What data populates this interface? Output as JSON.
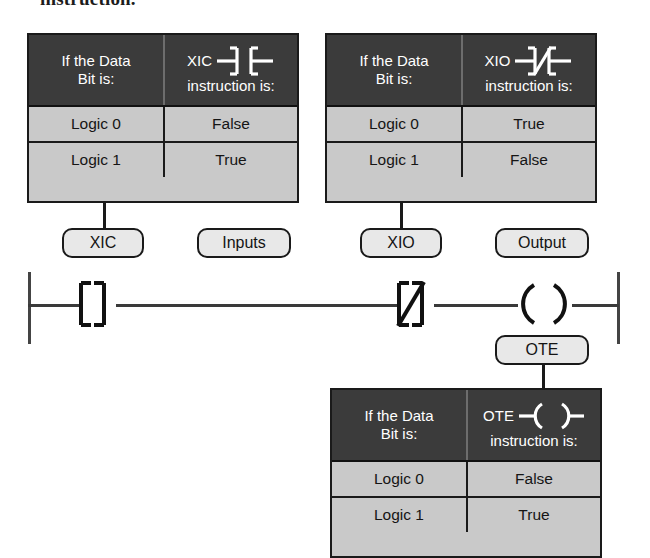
{
  "caption": {
    "cut_text": "instruction."
  },
  "tables": [
    {
      "id": "xic-truth-table",
      "header_left": "If the Data\nBit is:",
      "header_left_line1": "If the Data",
      "header_left_line2": "Bit is:",
      "header_right_label": "XIC",
      "header_right_symbol": "xic-contact-symbol",
      "header_right_sub": "instruction is:",
      "rows": [
        {
          "bit": "Logic 0",
          "state": "False"
        },
        {
          "bit": "Logic 1",
          "state": "True"
        }
      ]
    },
    {
      "id": "xio-truth-table",
      "header_left_line1": "If the Data",
      "header_left_line2": "Bit is:",
      "header_right_label": "XIO",
      "header_right_symbol": "xio-contact-symbol",
      "header_right_sub": "instruction is:",
      "rows": [
        {
          "bit": "Logic 0",
          "state": "True"
        },
        {
          "bit": "Logic 1",
          "state": "False"
        }
      ]
    },
    {
      "id": "ote-truth-table",
      "header_left_line1": "If the Data",
      "header_left_line2": "Bit is:",
      "header_right_label": "OTE",
      "header_right_symbol": "ote-coil-symbol",
      "header_right_sub": "instruction is:",
      "rows": [
        {
          "bit": "Logic 0",
          "state": "False"
        },
        {
          "bit": "Logic 1",
          "state": "True"
        }
      ]
    }
  ],
  "callouts": {
    "xic": "XIC",
    "inputs": "Inputs",
    "xio": "XIO",
    "output": "Output",
    "ote": "OTE"
  },
  "ladder": {
    "left_rail": "power-rail-left",
    "right_rail": "power-rail-right",
    "elements": [
      {
        "name": "xic-contact",
        "type": "normally-open-contact"
      },
      {
        "name": "xio-contact",
        "type": "normally-closed-contact"
      },
      {
        "name": "ote-coil",
        "type": "output-energize-coil"
      }
    ]
  },
  "colors": {
    "header_bg": "#3b3b3b",
    "body_bg": "#c9c9c9",
    "callout_bg": "#e8e8e8",
    "line": "#1a1a1a",
    "header_text": "#ffffff"
  }
}
